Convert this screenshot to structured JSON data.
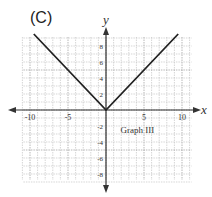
{
  "panel_label": "(C)",
  "chart_data": {
    "type": "line",
    "title": "Graph III",
    "xlabel": "x",
    "ylabel": "y",
    "xlim": [
      -11,
      11
    ],
    "ylim": [
      -9,
      9
    ],
    "grid": true,
    "x_ticks": [
      -10,
      -5,
      5,
      10
    ],
    "x_tick_labels": [
      "-10",
      "-5",
      "5",
      "10"
    ],
    "y_ticks": [
      8,
      6,
      4,
      2,
      -2,
      -4,
      -6,
      -8
    ],
    "y_tick_labels": [
      "8",
      "6",
      "4",
      "2",
      "-2",
      "-4",
      "-6",
      "-8"
    ],
    "series": [
      {
        "name": "y = |x|",
        "color": "#222222",
        "points": [
          [
            -9.5,
            9.5
          ],
          [
            0,
            0
          ],
          [
            9.5,
            9.5
          ]
        ]
      }
    ],
    "annotation": "Graph III",
    "annotation_position": [
      3.5,
      -2.5
    ]
  }
}
